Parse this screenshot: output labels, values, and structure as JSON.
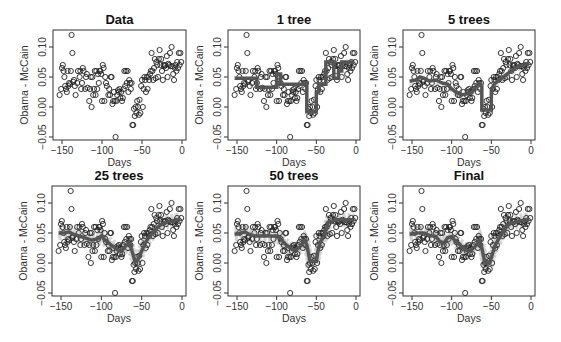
{
  "figure": {
    "ylabel": "Obama - McCain",
    "xlabel": "Days",
    "xticks": [
      -150,
      -100,
      -50,
      0
    ],
    "xtick_labels": [
      "−150",
      "−100",
      "−50",
      "0"
    ],
    "yticks": [
      -0.05,
      0.0,
      0.05,
      0.1
    ],
    "ytick_labels": [
      "−0.05",
      "0.00",
      "0.05",
      "0.10"
    ]
  },
  "chart_data": [
    {
      "type": "scatter",
      "title": "Data",
      "xlabel": "Days",
      "ylabel": "Obama - McCain",
      "xlim": [
        -157,
        3
      ],
      "ylim": [
        -0.055,
        0.13
      ],
      "grid": false,
      "points": "poll"
    },
    {
      "type": "line",
      "title": "1 tree",
      "xlabel": "Days",
      "ylabel": "Obama - McCain",
      "xlim": [
        -157,
        3
      ],
      "ylim": [
        -0.055,
        0.13
      ],
      "fit": {
        "x": [
          -153,
          -125,
          -125,
          -100,
          -100,
          -95,
          -95,
          -65,
          -65,
          -62,
          -62,
          -50,
          -50,
          -47,
          -47,
          -38,
          -38,
          -28,
          -28,
          -22,
          -22,
          -18,
          -18,
          -2
        ],
        "y": [
          0.048,
          0.048,
          0.033,
          0.033,
          0.055,
          0.055,
          0.038,
          0.038,
          0.04,
          0.04,
          -0.008,
          -0.008,
          0.025,
          0.025,
          0.038,
          0.038,
          0.075,
          0.075,
          0.048,
          0.048,
          0.06,
          0.06,
          0.075,
          0.075
        ]
      }
    },
    {
      "type": "line",
      "title": "5 trees",
      "xlabel": "Days",
      "ylabel": "Obama - McCain",
      "xlim": [
        -157,
        3
      ],
      "ylim": [
        -0.055,
        0.13
      ],
      "fit": {
        "x": [
          -153,
          -145,
          -140,
          -135,
          -128,
          -120,
          -112,
          -105,
          -100,
          -95,
          -88,
          -80,
          -75,
          -70,
          -65,
          -62,
          -62,
          -50,
          -50,
          -45,
          -40,
          -35,
          -30,
          -25,
          -20,
          -15,
          -10,
          -5,
          -2
        ],
        "y": [
          0.043,
          0.045,
          0.05,
          0.048,
          0.043,
          0.045,
          0.04,
          0.038,
          0.03,
          0.025,
          0.02,
          0.022,
          0.025,
          0.033,
          0.04,
          0.035,
          -0.005,
          -0.005,
          0.03,
          0.04,
          0.045,
          0.05,
          0.055,
          0.06,
          0.065,
          0.068,
          0.07,
          0.072,
          0.072
        ]
      }
    },
    {
      "type": "line",
      "title": "25 trees",
      "xlabel": "Days",
      "ylabel": "Obama - McCain",
      "xlim": [
        -157,
        3
      ],
      "ylim": [
        -0.055,
        0.13
      ],
      "fit": {
        "x": [
          -153,
          -145,
          -140,
          -135,
          -128,
          -120,
          -112,
          -105,
          -100,
          -95,
          -88,
          -80,
          -75,
          -70,
          -65,
          -62,
          -58,
          -55,
          -50,
          -45,
          -40,
          -35,
          -30,
          -25,
          -20,
          -15,
          -10,
          -5,
          -2
        ],
        "y": [
          0.05,
          0.05,
          0.052,
          0.048,
          0.045,
          0.042,
          0.038,
          0.04,
          0.045,
          0.038,
          0.03,
          0.022,
          0.02,
          0.028,
          0.035,
          0.02,
          0.002,
          0.005,
          0.02,
          0.035,
          0.045,
          0.052,
          0.06,
          0.065,
          0.068,
          0.07,
          0.07,
          0.072,
          0.072
        ]
      }
    },
    {
      "type": "line",
      "title": "50 trees",
      "xlabel": "Days",
      "ylabel": "Obama - McCain",
      "xlim": [
        -157,
        3
      ],
      "ylim": [
        -0.055,
        0.13
      ],
      "fit": {
        "x": [
          -153,
          -145,
          -140,
          -135,
          -128,
          -120,
          -112,
          -105,
          -100,
          -95,
          -88,
          -80,
          -75,
          -70,
          -65,
          -62,
          -58,
          -50,
          -48,
          -45,
          -40,
          -35,
          -30,
          -25,
          -20,
          -15,
          -10,
          -5,
          -2
        ],
        "y": [
          0.048,
          0.05,
          0.052,
          0.048,
          0.045,
          0.045,
          0.045,
          0.045,
          0.045,
          0.04,
          0.03,
          0.022,
          0.022,
          0.028,
          0.038,
          0.03,
          0.003,
          0.003,
          0.02,
          0.035,
          0.045,
          0.068,
          0.07,
          0.072,
          0.072,
          0.072,
          0.072,
          0.072,
          0.072
        ]
      }
    },
    {
      "type": "line",
      "title": "Final",
      "xlabel": "Days",
      "ylabel": "Obama - McCain",
      "xlim": [
        -157,
        3
      ],
      "ylim": [
        -0.055,
        0.13
      ],
      "fit": {
        "x": [
          -153,
          -145,
          -140,
          -135,
          -128,
          -120,
          -115,
          -110,
          -105,
          -100,
          -95,
          -88,
          -80,
          -75,
          -70,
          -65,
          -62,
          -58,
          -52,
          -48,
          -45,
          -40,
          -35,
          -30,
          -25,
          -20,
          -15,
          -10,
          -5,
          -2
        ],
        "y": [
          0.048,
          0.05,
          0.05,
          0.05,
          0.046,
          0.044,
          0.036,
          0.033,
          0.042,
          0.044,
          0.036,
          0.028,
          0.02,
          0.022,
          0.028,
          0.038,
          0.025,
          0.0,
          0.0,
          0.018,
          0.03,
          0.042,
          0.052,
          0.062,
          0.067,
          0.068,
          0.07,
          0.071,
          0.072,
          0.072
        ]
      }
    }
  ],
  "poll": {
    "x": [
      -153,
      -151,
      -150,
      -149,
      -148,
      -147,
      -146,
      -145,
      -144,
      -143,
      -142,
      -141,
      -140,
      -139,
      -138,
      -137,
      -136,
      -135,
      -134,
      -133,
      -131,
      -130,
      -128,
      -127,
      -126,
      -125,
      -124,
      -123,
      -121,
      -120,
      -119,
      -118,
      -116,
      -115,
      -114,
      -113,
      -112,
      -111,
      -110,
      -109,
      -108,
      -107,
      -106,
      -105,
      -104,
      -103,
      -102,
      -101,
      -100,
      -99,
      -98,
      -97,
      -96,
      -95,
      -94,
      -92,
      -91,
      -90,
      -89,
      -88,
      -87,
      -86,
      -85,
      -84,
      -83,
      -82,
      -81,
      -80,
      -79,
      -78,
      -77,
      -76,
      -75,
      -74,
      -73,
      -72,
      -71,
      -70,
      -69,
      -68,
      -67,
      -66,
      -65,
      -64,
      -63,
      -62,
      -61,
      -60,
      -59,
      -58,
      -57,
      -56,
      -55,
      -54,
      -53,
      -52,
      -51,
      -50,
      -49,
      -48,
      -47,
      -46,
      -45,
      -44,
      -43,
      -42,
      -41,
      -40,
      -39,
      -38,
      -37,
      -36,
      -35,
      -34,
      -33,
      -32,
      -31,
      -30,
      -29,
      -28,
      -27,
      -26,
      -25,
      -24,
      -23,
      -22,
      -21,
      -20,
      -19,
      -18,
      -17,
      -16,
      -15,
      -14,
      -13,
      -12,
      -11,
      -10,
      -9,
      -8,
      -7,
      -6,
      -5,
      -4,
      -3,
      -2,
      -1
    ],
    "y": [
      0.02,
      0.03,
      0.065,
      0.07,
      0.06,
      0.05,
      0.035,
      0.03,
      0.025,
      0.06,
      0.035,
      0.04,
      0.038,
      0.06,
      0.12,
      0.09,
      0.042,
      0.045,
      0.035,
      0.02,
      0.04,
      0.06,
      0.05,
      0.06,
      0.03,
      0.04,
      0.065,
      0.06,
      0.03,
      0.05,
      0.055,
      0.032,
      0.01,
      0.03,
      0.05,
      0.0,
      0.05,
      0.02,
      0.03,
      0.06,
      0.02,
      0.06,
      0.03,
      0.055,
      0.04,
      0.06,
      0.06,
      0.055,
      0.01,
      0.07,
      0.065,
      0.01,
      0.05,
      0.04,
      0.035,
      0.02,
      0.03,
      0.02,
      0.05,
      0.05,
      0.005,
      0.01,
      0.025,
      0.01,
      -0.05,
      0.01,
      0.02,
      0.028,
      0.025,
      0.03,
      0.015,
      0.025,
      0.01,
      0.015,
      0.03,
      0.06,
      0.035,
      0.06,
      0.04,
      0.06,
      0.025,
      0.045,
      0.04,
      0.03,
      0.04,
      -0.03,
      -0.03,
      -0.003,
      -0.015,
      0.0,
      -0.01,
      0.01,
      0.0,
      -0.013,
      0.012,
      -0.01,
      0.035,
      0.045,
      0.0,
      0.03,
      0.05,
      0.045,
      0.025,
      0.05,
      0.03,
      0.05,
      0.045,
      0.055,
      0.06,
      0.09,
      0.06,
      0.045,
      0.065,
      0.08,
      0.048,
      0.075,
      0.07,
      0.05,
      0.08,
      0.095,
      0.07,
      0.08,
      0.06,
      0.045,
      0.07,
      0.068,
      0.07,
      0.065,
      0.085,
      0.05,
      0.072,
      0.07,
      0.09,
      0.068,
      0.1,
      0.068,
      0.055,
      0.045,
      0.065,
      0.07,
      0.06,
      0.075,
      0.065,
      0.09,
      0.07,
      0.09,
      0.075
    ]
  }
}
